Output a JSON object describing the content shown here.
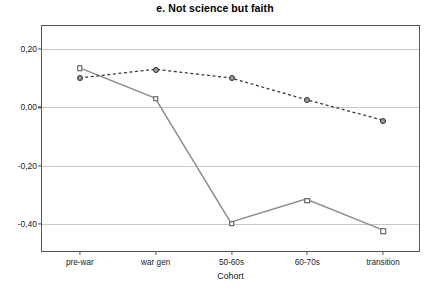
{
  "chart_data": {
    "type": "line",
    "title": "e. Not science but faith",
    "xlabel": "Cohort",
    "ylabel": "",
    "categories": [
      "pre-war",
      "war gen",
      "50-60s",
      "60-70s",
      "transition"
    ],
    "ylim": [
      -0.5,
      0.28
    ],
    "yticks": [
      0.2,
      0.0,
      -0.2,
      -0.4
    ],
    "ytick_labels": [
      "0,20",
      "0,00",
      "-0,20",
      "-0,40"
    ],
    "grid": true,
    "legend": "none",
    "series": [
      {
        "name": "series-squares",
        "marker": "square",
        "line_style": "solid",
        "color": "#8c8c8c",
        "values": [
          0.135,
          0.03,
          -0.4,
          -0.32,
          -0.425
        ]
      },
      {
        "name": "series-circles",
        "marker": "circle",
        "line_style": "dashed",
        "color": "#3a3a3a",
        "values": [
          0.1,
          0.13,
          0.1,
          0.025,
          -0.045
        ]
      }
    ]
  },
  "colors": {
    "frame": "#555555",
    "gridline": "#c8c8c8",
    "background": "#ffffff",
    "text": "#1a1a1a"
  }
}
